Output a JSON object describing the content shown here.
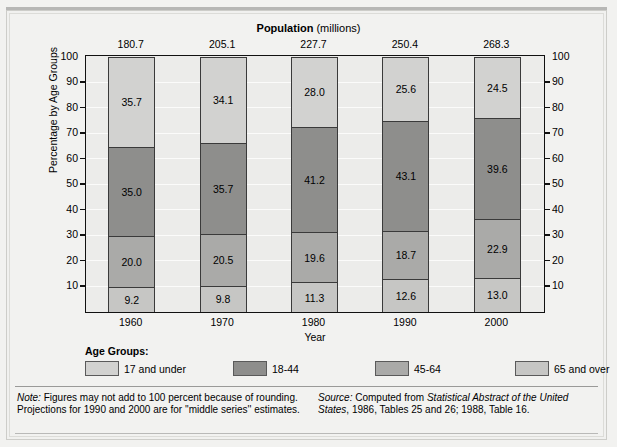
{
  "header": {
    "title_bold": "Population",
    "title_reg": " (millions)"
  },
  "axes": {
    "ylabel": "Percentage by Age Groups",
    "xlabel": "Year",
    "yticks": [
      "100",
      "90",
      "80",
      "70",
      "60",
      "50",
      "40",
      "30",
      "20",
      "10"
    ]
  },
  "legend": {
    "title": "Age Groups:",
    "items": [
      {
        "label": "17 and under",
        "color": "#d2d2d0"
      },
      {
        "label": "18-44",
        "color": "#8e8e8c"
      },
      {
        "label": "45-64",
        "color": "#aaaaa8"
      },
      {
        "label": "65 and over",
        "color": "#c6c6c4"
      }
    ]
  },
  "footer": {
    "note_label": "Note:",
    "note_text": " Figures may not add to 100 percent because of rounding. Projections for 1990 and 2000 are for ''middle series'' estimates.",
    "source_label": "Source:",
    "source_pre": " Computed from ",
    "source_italic": "Statistical Abstract of the United States",
    "source_post": ", 1986, Tables 25 and 26; 1988, Table 16."
  },
  "chart_data": {
    "type": "bar",
    "title": "Population (millions)",
    "xlabel": "Year",
    "ylabel": "Percentage by Age Groups",
    "ylim": [
      0,
      100
    ],
    "grid": true,
    "legend_position": "bottom",
    "stacked": true,
    "categories": [
      "1960",
      "1970",
      "1980",
      "1990",
      "2000"
    ],
    "population_millions": [
      "180.7",
      "205.1",
      "227.7",
      "250.4",
      "268.3"
    ],
    "series": [
      {
        "name": "17 and under",
        "color": "#d2d2d0",
        "values": [
          35.7,
          34.1,
          28.0,
          25.6,
          24.5
        ]
      },
      {
        "name": "18-44",
        "color": "#8e8e8c",
        "values": [
          35.0,
          35.7,
          41.2,
          43.1,
          39.6
        ]
      },
      {
        "name": "45-64",
        "color": "#aaaaa8",
        "values": [
          20.0,
          20.5,
          19.6,
          18.7,
          22.9
        ]
      },
      {
        "name": "65 and over",
        "color": "#c6c6c4",
        "values": [
          9.2,
          9.8,
          11.3,
          12.6,
          13.0
        ]
      }
    ],
    "bar_labels": [
      [
        "35.7",
        "35.0",
        "20.0",
        "9.2"
      ],
      [
        "34.1",
        "35.7",
        "20.5",
        "9.8"
      ],
      [
        "28.0",
        "41.2",
        "19.6",
        "11.3"
      ],
      [
        "25.6",
        "43.1",
        "18.7",
        "12.6"
      ],
      [
        "24.5",
        "39.6",
        "22.9",
        "13.0"
      ]
    ]
  }
}
